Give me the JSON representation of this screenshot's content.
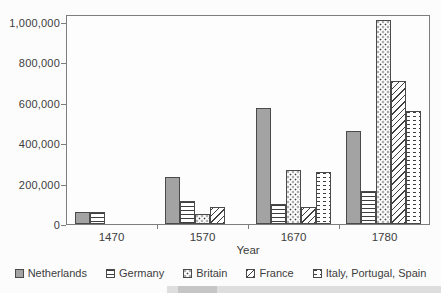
{
  "chart_data": {
    "type": "bar",
    "title": "",
    "xlabel": "Year",
    "ylabel": "",
    "categories": [
      "1470",
      "1570",
      "1670",
      "1780"
    ],
    "series": [
      {
        "name": "Netherlands",
        "pattern": "solid",
        "values": [
          60000,
          235000,
          575000,
          460000
        ]
      },
      {
        "name": "Germany",
        "pattern": "hlines",
        "values": [
          60000,
          115000,
          100000,
          165000
        ]
      },
      {
        "name": "Britain",
        "pattern": "dots",
        "values": [
          null,
          50000,
          265000,
          1010000
        ]
      },
      {
        "name": "France",
        "pattern": "diagonal",
        "values": [
          null,
          85000,
          85000,
          710000
        ]
      },
      {
        "name": "Italy, Portugal, Spain",
        "pattern": "dashes",
        "values": [
          null,
          null,
          255000,
          560000
        ]
      }
    ],
    "ylim": [
      0,
      1040000
    ],
    "yticks": [
      0,
      200000,
      400000,
      600000,
      800000,
      1000000
    ],
    "ytick_labels": [
      "0",
      "200,000",
      "400,000",
      "600,000",
      "800,000",
      "1,000,000"
    ],
    "grid": "off",
    "legend_position": "bottom"
  },
  "colors": {
    "background": "#fcfcfc",
    "plot_background": "#fdfdfd",
    "axis": "#7d7d7d",
    "text": "#3c3c3c",
    "bar_solid_fill": "#a3a3a3",
    "bar_border": "#4a4a4a",
    "pattern_ink": "#3f3f3f",
    "scan_artifact": "#dedede"
  }
}
